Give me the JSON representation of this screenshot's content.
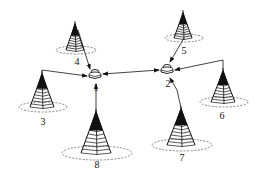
{
  "diagram": {
    "type": "wireless network topology",
    "colors": {
      "line": "#111111",
      "background": "#ffffff",
      "dashed_ellipse": "#555555"
    },
    "routers": [
      {
        "id": "1",
        "label": "1",
        "x": 95,
        "y": 75,
        "label_x": 96,
        "label_y": 83
      },
      {
        "id": "2",
        "label": "2",
        "x": 167,
        "y": 70,
        "label_x": 168,
        "label_y": 79
      }
    ],
    "towers": [
      {
        "id": "3",
        "label": "3",
        "apex_x": 42,
        "apex_y": 74,
        "base_y": 107,
        "half_w": 12,
        "ring_rx": 24,
        "ring_ry": 5,
        "label_x": 43,
        "label_y": 117
      },
      {
        "id": "4",
        "label": "4",
        "apex_x": 75,
        "apex_y": 24,
        "base_y": 50,
        "half_w": 9,
        "ring_rx": 20,
        "ring_ry": 4,
        "label_x": 77,
        "label_y": 57
      },
      {
        "id": "5",
        "label": "5",
        "apex_x": 183,
        "apex_y": 13,
        "base_y": 38,
        "half_w": 9,
        "ring_rx": 19,
        "ring_ry": 4,
        "label_x": 184,
        "label_y": 46
      },
      {
        "id": "6",
        "label": "6",
        "apex_x": 223,
        "apex_y": 71,
        "base_y": 102,
        "half_w": 12,
        "ring_rx": 24,
        "ring_ry": 5,
        "label_x": 222,
        "label_y": 111
      },
      {
        "id": "7",
        "label": "7",
        "apex_x": 181,
        "apex_y": 109,
        "base_y": 145,
        "half_w": 14,
        "ring_rx": 30,
        "ring_ry": 6,
        "label_x": 182,
        "label_y": 153
      },
      {
        "id": "8",
        "label": "8",
        "apex_x": 96,
        "apex_y": 112,
        "base_y": 153,
        "half_w": 15,
        "ring_rx": 35,
        "ring_ry": 7,
        "label_x": 97,
        "label_y": 160
      }
    ],
    "links": [
      {
        "from": "4",
        "to": "1",
        "points": [
          [
            78,
            30
          ],
          [
            90,
            69
          ]
        ]
      },
      {
        "from": "3",
        "to": "1",
        "points": [
          [
            42,
            73
          ],
          [
            42,
            70
          ],
          [
            87,
            76
          ]
        ]
      },
      {
        "from": "8",
        "to": "1",
        "points": [
          [
            96,
            112
          ],
          [
            96,
            84
          ]
        ]
      },
      {
        "from": "1",
        "to": "2",
        "points": [
          [
            103,
            74
          ],
          [
            159,
            70
          ]
        ],
        "bidirectional": true
      },
      {
        "from": "5",
        "to": "2",
        "points": [
          [
            184,
            38
          ],
          [
            170,
            62
          ]
        ]
      },
      {
        "from": "6",
        "to": "2",
        "points": [
          [
            223,
            70
          ],
          [
            223,
            60
          ],
          [
            175,
            70
          ]
        ]
      },
      {
        "from": "7",
        "to": "2",
        "points": [
          [
            181,
            108
          ],
          [
            177,
            90
          ],
          [
            170,
            78
          ]
        ]
      }
    ]
  }
}
